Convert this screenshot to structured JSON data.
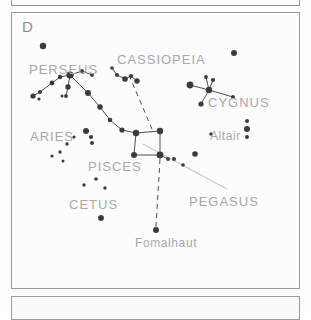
{
  "panels": {
    "top_partial": {
      "name": "upper-panel-partial"
    },
    "bottom_partial": {
      "name": "lower-panel-partial"
    },
    "main": {
      "letter": "D"
    }
  },
  "colors": {
    "star": "#3b3b3b",
    "line": "#3b3b3b",
    "leader_line": "#c9c9c9",
    "label_text": "#a8a8a8",
    "panel_border": "#9a9a9a",
    "background": "#fcfcfc"
  },
  "chart_data": {
    "type": "scatter",
    "title": "D",
    "xlabel": "",
    "ylabel": "",
    "xlim": [
      0,
      289
    ],
    "ylim": [
      0,
      277
    ],
    "grid": false,
    "legend": false,
    "labels": [
      {
        "text": "PERSEUS",
        "x": 17,
        "y": 50,
        "size": "big"
      },
      {
        "text": "CASSIOPEIA",
        "x": 105,
        "y": 40,
        "size": "big"
      },
      {
        "text": "CYGNUS",
        "x": 196,
        "y": 83,
        "size": "big"
      },
      {
        "text": "ARIES",
        "x": 18,
        "y": 117,
        "size": "big"
      },
      {
        "text": "Altair",
        "x": 198,
        "y": 117,
        "size": "mid"
      },
      {
        "text": "PISCES",
        "x": 76,
        "y": 147,
        "size": "big"
      },
      {
        "text": "PEGASUS",
        "x": 177,
        "y": 182,
        "size": "big"
      },
      {
        "text": "CETUS",
        "x": 57,
        "y": 185,
        "size": "big"
      },
      {
        "text": "Fomalhaut",
        "x": 123,
        "y": 224,
        "size": "mid"
      }
    ],
    "stars": [
      {
        "name": "perseus-alpha",
        "x": 31,
        "y": 33,
        "r": 3.2
      },
      {
        "name": "perseus-hub",
        "x": 58,
        "y": 62,
        "r": 3.6
      },
      {
        "name": "perseus-e1",
        "x": 70,
        "y": 58,
        "r": 1.9
      },
      {
        "name": "perseus-e2",
        "x": 80,
        "y": 62,
        "r": 1.9
      },
      {
        "name": "perseus-w1",
        "x": 48,
        "y": 64,
        "r": 2.2
      },
      {
        "name": "perseus-w2",
        "x": 40,
        "y": 70,
        "r": 2.4
      },
      {
        "name": "perseus-w3",
        "x": 28,
        "y": 79,
        "r": 2.1
      },
      {
        "name": "perseus-w4",
        "x": 21,
        "y": 83,
        "r": 2.6
      },
      {
        "name": "perseus-w5",
        "x": 27,
        "y": 86,
        "r": 1.6
      },
      {
        "name": "perseus-s1",
        "x": 56,
        "y": 74,
        "r": 2.7
      },
      {
        "name": "perseus-s2",
        "x": 54,
        "y": 83,
        "r": 1.9
      },
      {
        "name": "perseus-s3",
        "x": 50,
        "y": 83,
        "r": 1.5
      },
      {
        "name": "andromeda-a1",
        "x": 76,
        "y": 80,
        "r": 3.0
      },
      {
        "name": "andromeda-a2",
        "x": 88,
        "y": 94,
        "r": 2.8
      },
      {
        "name": "andromeda-a3",
        "x": 98,
        "y": 107,
        "r": 2.3
      },
      {
        "name": "andromeda-a4",
        "x": 110,
        "y": 117,
        "r": 2.6
      },
      {
        "name": "cassiopeia-c1",
        "x": 100,
        "y": 55,
        "r": 1.8
      },
      {
        "name": "cassiopeia-c2",
        "x": 105,
        "y": 62,
        "r": 2.0
      },
      {
        "name": "cassiopeia-c3",
        "x": 113,
        "y": 66,
        "r": 2.8
      },
      {
        "name": "cassiopeia-c4",
        "x": 119,
        "y": 63,
        "r": 2.0
      },
      {
        "name": "cassiopeia-c5",
        "x": 125,
        "y": 68,
        "r": 2.7
      },
      {
        "name": "cygnus-deneb",
        "x": 178,
        "y": 72,
        "r": 3.4
      },
      {
        "name": "cygnus-center",
        "x": 197,
        "y": 77,
        "r": 3.2
      },
      {
        "name": "cygnus-top",
        "x": 194,
        "y": 64,
        "r": 1.9
      },
      {
        "name": "cygnus-upper",
        "x": 201,
        "y": 67,
        "r": 2.1
      },
      {
        "name": "cygnus-bottom",
        "x": 189,
        "y": 91,
        "r": 2.6
      },
      {
        "name": "cygnus-tip",
        "x": 221,
        "y": 84,
        "r": 2.0
      },
      {
        "name": "lone-upper-right",
        "x": 222,
        "y": 40,
        "r": 3.0
      },
      {
        "name": "square-nw",
        "x": 124,
        "y": 120,
        "r": 3.2
      },
      {
        "name": "square-ne",
        "x": 148,
        "y": 118,
        "r": 3.2
      },
      {
        "name": "square-sw",
        "x": 122,
        "y": 142,
        "r": 3.0
      },
      {
        "name": "square-se",
        "x": 148,
        "y": 142,
        "r": 3.4
      },
      {
        "name": "pegasus-p1",
        "x": 156,
        "y": 146,
        "r": 1.9
      },
      {
        "name": "pegasus-p2",
        "x": 162,
        "y": 146,
        "r": 2.0
      },
      {
        "name": "pegasus-p3",
        "x": 171,
        "y": 152,
        "r": 1.8
      },
      {
        "name": "pegasus-p4",
        "x": 183,
        "y": 141,
        "r": 2.8
      },
      {
        "name": "pegasus-p5",
        "x": 199,
        "y": 121,
        "r": 1.8
      },
      {
        "name": "aries-a1",
        "x": 74,
        "y": 118,
        "r": 3.0
      },
      {
        "name": "aries-a2",
        "x": 79,
        "y": 124,
        "r": 2.1
      },
      {
        "name": "aries-a3",
        "x": 80,
        "y": 130,
        "r": 2.0
      },
      {
        "name": "pisces-f1",
        "x": 55,
        "y": 131,
        "r": 1.7
      },
      {
        "name": "pisces-f2",
        "x": 62,
        "y": 124,
        "r": 1.6
      },
      {
        "name": "pisces-f3",
        "x": 48,
        "y": 139,
        "r": 1.7
      },
      {
        "name": "pisces-f4",
        "x": 40,
        "y": 143,
        "r": 1.6
      },
      {
        "name": "pisces-f5",
        "x": 51,
        "y": 148,
        "r": 1.5
      },
      {
        "name": "cetus-t1",
        "x": 72,
        "y": 172,
        "r": 1.7
      },
      {
        "name": "cetus-t2",
        "x": 84,
        "y": 166,
        "r": 1.8
      },
      {
        "name": "cetus-t3",
        "x": 93,
        "y": 175,
        "r": 1.7
      },
      {
        "name": "cetus-t4",
        "x": 89,
        "y": 205,
        "r": 2.9
      },
      {
        "name": "altair-top",
        "x": 235,
        "y": 108,
        "r": 2.0
      },
      {
        "name": "altair-main",
        "x": 235,
        "y": 116,
        "r": 3.0
      },
      {
        "name": "altair-bottom",
        "x": 235,
        "y": 124,
        "r": 2.0
      },
      {
        "name": "fomalhaut",
        "x": 144,
        "y": 217,
        "r": 3.0
      }
    ],
    "constellation_lines": [
      {
        "name": "perseus-hub-e1",
        "from": "perseus-hub",
        "to": "perseus-e1"
      },
      {
        "name": "perseus-e1-e2",
        "from": "perseus-e1",
        "to": "perseus-e2"
      },
      {
        "name": "perseus-hub-w1",
        "from": "perseus-hub",
        "to": "perseus-w1"
      },
      {
        "name": "perseus-w1-w2",
        "from": "perseus-w1",
        "to": "perseus-w2"
      },
      {
        "name": "perseus-w2-w3",
        "from": "perseus-w2",
        "to": "perseus-w3"
      },
      {
        "name": "perseus-w3-w4",
        "from": "perseus-w3",
        "to": "perseus-w4"
      },
      {
        "name": "perseus-hub-s1",
        "from": "perseus-hub",
        "to": "perseus-s1"
      },
      {
        "name": "perseus-s1-s2",
        "from": "perseus-s1",
        "to": "perseus-s2"
      },
      {
        "name": "perseus-hub-and",
        "from": "perseus-hub",
        "to": "andromeda-a1"
      },
      {
        "name": "and-a1-a2",
        "from": "andromeda-a1",
        "to": "andromeda-a2"
      },
      {
        "name": "and-a2-a3",
        "from": "andromeda-a2",
        "to": "andromeda-a3"
      },
      {
        "name": "and-a3-a4",
        "from": "andromeda-a3",
        "to": "andromeda-a4"
      },
      {
        "name": "and-a4-square",
        "from": "andromeda-a4",
        "to": "square-nw"
      },
      {
        "name": "cas-c1-c2",
        "from": "cassiopeia-c1",
        "to": "cassiopeia-c2"
      },
      {
        "name": "cas-c2-c3",
        "from": "cassiopeia-c2",
        "to": "cassiopeia-c3"
      },
      {
        "name": "cas-c3-c4",
        "from": "cassiopeia-c3",
        "to": "cassiopeia-c4"
      },
      {
        "name": "cas-c4-c5",
        "from": "cassiopeia-c4",
        "to": "cassiopeia-c5"
      },
      {
        "name": "cyg-deneb-center",
        "from": "cygnus-deneb",
        "to": "cygnus-center"
      },
      {
        "name": "cyg-center-tip",
        "from": "cygnus-center",
        "to": "cygnus-tip"
      },
      {
        "name": "cyg-top-center",
        "from": "cygnus-top",
        "to": "cygnus-center"
      },
      {
        "name": "cyg-upper-center",
        "from": "cygnus-upper",
        "to": "cygnus-center"
      },
      {
        "name": "cyg-center-bot",
        "from": "cygnus-center",
        "to": "cygnus-bottom"
      },
      {
        "name": "sq-nw-ne",
        "from": "square-nw",
        "to": "square-ne"
      },
      {
        "name": "sq-ne-se",
        "from": "square-ne",
        "to": "square-se"
      },
      {
        "name": "sq-se-sw",
        "from": "square-se",
        "to": "square-sw"
      },
      {
        "name": "sq-sw-nw",
        "from": "square-sw",
        "to": "square-nw"
      },
      {
        "name": "peg-se-p1",
        "from": "square-se",
        "to": "pegasus-p1"
      }
    ],
    "dashed_lines": [
      {
        "name": "cassiopeia-to-square",
        "x1": 117,
        "y1": 62,
        "x2": 140,
        "y2": 116
      },
      {
        "name": "square-to-fomalhaut",
        "x1": 148,
        "y1": 146,
        "x2": 144,
        "y2": 214
      }
    ],
    "leader_lines": [
      {
        "name": "pegasus-label-leader",
        "x1": 131,
        "y1": 131,
        "x2": 215,
        "y2": 176
      }
    ]
  }
}
